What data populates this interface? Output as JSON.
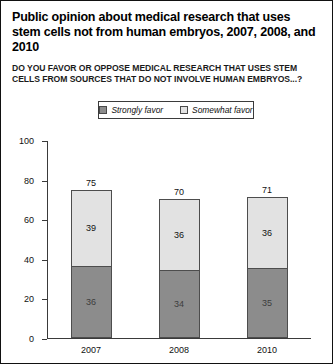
{
  "title": "Public opinion about medical research that uses stem cells not from human embryos, 2007, 2008, and 2010",
  "subtitle": "DO YOU FAVOR OR OPPOSE MEDICAL RESEARCH THAT USES STEM CELLS FROM SOURCES THAT DO NOT INVOLVE HUMAN EMBRYOS...?",
  "legend": {
    "entries": [
      {
        "label": "Strongly favor",
        "color": "#8c8c8c"
      },
      {
        "label": "Somewhat favor",
        "color": "#e2e2e2"
      }
    ]
  },
  "axis": {
    "y_ticks": [
      "0",
      "20",
      "40",
      "60",
      "80",
      "100"
    ]
  },
  "chart_data": {
    "type": "bar",
    "title": "Public opinion about medical research that uses stem cells not from human embryos, 2007, 2008, and 2010",
    "subtitle": "DO YOU FAVOR OR OPPOSE MEDICAL RESEARCH THAT USES STEM CELLS FROM SOURCES THAT DO NOT INVOLVE HUMAN EMBRYOS...?",
    "stacked": true,
    "categories": [
      "2007",
      "2008",
      "2010"
    ],
    "series": [
      {
        "name": "Strongly favor",
        "values": [
          36,
          34,
          35
        ],
        "color": "#8c8c8c"
      },
      {
        "name": "Somewhat favor",
        "values": [
          39,
          36,
          36
        ],
        "color": "#e2e2e2"
      }
    ],
    "totals": [
      75,
      70,
      71
    ],
    "xlabel": "",
    "ylabel": "",
    "ylim": [
      0,
      100
    ],
    "yticks": [
      0,
      20,
      40,
      60,
      80,
      100
    ],
    "grid": false,
    "legend_position": "top-center",
    "bars": [
      {
        "category": "2007",
        "total": 75,
        "total_label": "75",
        "segments": [
          {
            "name": "Somewhat favor",
            "value": 39,
            "label": "39"
          },
          {
            "name": "Strongly favor",
            "value": 36,
            "label": "36"
          }
        ]
      },
      {
        "category": "2008",
        "total": 70,
        "total_label": "70",
        "segments": [
          {
            "name": "Somewhat favor",
            "value": 36,
            "label": "36"
          },
          {
            "name": "Strongly favor",
            "value": 34,
            "label": "34"
          }
        ]
      },
      {
        "category": "2010",
        "total": 71,
        "total_label": "71",
        "segments": [
          {
            "name": "Somewhat favor",
            "value": 36,
            "label": "36"
          },
          {
            "name": "Strongly favor",
            "value": 35,
            "label": "35"
          }
        ]
      }
    ]
  }
}
